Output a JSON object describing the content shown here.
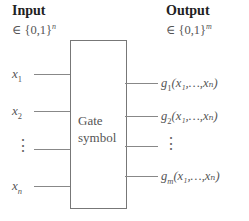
{
  "input": {
    "header": "Input",
    "domain": "∈ {0,1}",
    "domain_exp": "n",
    "variables": [
      {
        "name": "x",
        "sub": "1"
      },
      {
        "name": "x",
        "sub": "2"
      },
      {
        "name": "⋮",
        "sub": ""
      },
      {
        "name": "x",
        "sub": "n"
      }
    ]
  },
  "output": {
    "header": "Output",
    "domain": "∈ {0,1}",
    "domain_exp": "m",
    "functions": [
      {
        "fn": "g",
        "sub": "1",
        "args": "(x₁,…,xₙ)"
      },
      {
        "fn": "g",
        "sub": "2",
        "args": "(x₁,…,xₙ)"
      },
      {
        "fn": "⋮",
        "sub": "",
        "args": ""
      },
      {
        "fn": "g",
        "sub": "m",
        "args": "(x₁,…,xₙ)"
      }
    ]
  },
  "gate": {
    "line1": "Gate",
    "line2": "symbol"
  }
}
